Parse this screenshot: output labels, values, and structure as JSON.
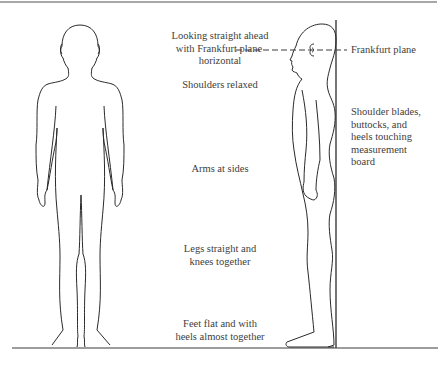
{
  "diagram": {
    "colors": {
      "line": "#2a2a2a",
      "border": "#8a8a8a",
      "text": "#404040",
      "background": "#ffffff"
    },
    "figures": [
      {
        "id": "front-view",
        "description": "Front view of child standing"
      },
      {
        "id": "side-view",
        "description": "Side profile of child standing against measurement board"
      }
    ],
    "labels": {
      "looking": {
        "line1": "Looking straight ahead",
        "line2": "with Frankfurt plane",
        "line3": "horizontal"
      },
      "shoulders": "Shoulders relaxed",
      "arms": "Arms at sides",
      "legs": {
        "line1": "Legs straight and",
        "line2": "knees together"
      },
      "feet": {
        "line1": "Feet flat and with",
        "line2": "heels almost together"
      },
      "frankfurt": "Frankfurt plane",
      "board": {
        "line1": "Shoulder blades,",
        "line2": "buttocks, and",
        "line3": "heels touching",
        "line4": "measurement",
        "line5": "board"
      }
    }
  }
}
